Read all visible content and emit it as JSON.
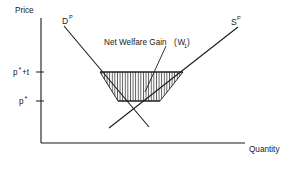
{
  "figure": {
    "background_color": "#ffffff",
    "line_color": "#1a1a1a"
  },
  "axes": {
    "y_label": "Price",
    "x_label": "Quantity",
    "origin_x": 41,
    "origin_y": 143,
    "y_top": 18,
    "x_right": 245
  },
  "price_levels": [
    {
      "name": "tariff-price",
      "base": "p",
      "star": "*",
      "suffix": "+t",
      "label": "p*+t",
      "y": 72
    },
    {
      "name": "world-price",
      "base": "p",
      "star": "*",
      "suffix": "",
      "label": "p*",
      "y": 101
    }
  ],
  "curves": [
    {
      "name": "demand-curve",
      "base": "D",
      "superscript": "P",
      "label": "Dᴾ",
      "label_x": 62,
      "label_y": 23,
      "x1": 64,
      "y1": 26,
      "x2": 149,
      "y2": 127
    },
    {
      "name": "supply-curve",
      "base": "S",
      "superscript": "P",
      "label": "Sᴾ",
      "label_x": 232,
      "label_y": 23,
      "x1": 109,
      "y1": 128,
      "x2": 238,
      "y2": 27
    }
  ],
  "annotation": {
    "name": "net-welfare-gain",
    "text": "Net Welfare Gain",
    "paren_open": "(",
    "symbol": "W",
    "subscript": "1",
    "paren_close": ")",
    "full_label": "Net Welfare Gain (W₁)",
    "text_x": 104,
    "text_y": 42,
    "leader_from_x": 166,
    "leader_from_y": 46,
    "leader_to_x": 145,
    "leader_to_y": 92
  },
  "shaded_region": {
    "name": "net-welfare-gain-region",
    "description": "hatched trapezoid between world price and tariff price bounded by demand and supply curves",
    "hatch_style": "vertical lines",
    "hatch_spacing_px": 2.6,
    "top_left_x": 100,
    "top_right_x": 183,
    "top_y": 72,
    "bottom_left_x": 118,
    "bottom_right_x": 160,
    "bottom_y": 101
  }
}
